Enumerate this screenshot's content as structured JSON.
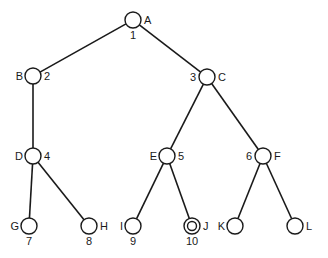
{
  "diagram": {
    "type": "tree",
    "nodes": [
      {
        "id": "A",
        "order": "1",
        "x": 133,
        "y": 20,
        "label_pos": "right",
        "order_pos": "below"
      },
      {
        "id": "B",
        "order": "2",
        "x": 33,
        "y": 76,
        "label_pos": "left",
        "order_pos": "right"
      },
      {
        "id": "C",
        "order": "3",
        "x": 207,
        "y": 77,
        "label_pos": "right",
        "order_pos": "left"
      },
      {
        "id": "D",
        "order": "4",
        "x": 33,
        "y": 156,
        "label_pos": "left",
        "order_pos": "right"
      },
      {
        "id": "E",
        "order": "5",
        "x": 167,
        "y": 156,
        "label_pos": "left",
        "order_pos": "right"
      },
      {
        "id": "F",
        "order": "6",
        "x": 263,
        "y": 156,
        "label_pos": "right",
        "order_pos": "left"
      },
      {
        "id": "G",
        "order": "7",
        "x": 29,
        "y": 226,
        "label_pos": "left",
        "order_pos": "below"
      },
      {
        "id": "H",
        "order": "8",
        "x": 89,
        "y": 226,
        "label_pos": "right",
        "order_pos": "below"
      },
      {
        "id": "I",
        "order": "9",
        "x": 133,
        "y": 226,
        "label_pos": "left",
        "order_pos": "below"
      },
      {
        "id": "J",
        "order": "10",
        "x": 192,
        "y": 226,
        "label_pos": "right",
        "order_pos": "below",
        "goal": true
      },
      {
        "id": "K",
        "order": "",
        "x": 235,
        "y": 226,
        "label_pos": "left",
        "order_pos": "none"
      },
      {
        "id": "L",
        "order": "",
        "x": 295,
        "y": 226,
        "label_pos": "right",
        "order_pos": "none"
      }
    ],
    "edges": [
      [
        "A",
        "B"
      ],
      [
        "A",
        "C"
      ],
      [
        "B",
        "D"
      ],
      [
        "C",
        "E"
      ],
      [
        "C",
        "F"
      ],
      [
        "D",
        "G"
      ],
      [
        "D",
        "H"
      ],
      [
        "E",
        "I"
      ],
      [
        "E",
        "J"
      ],
      [
        "F",
        "K"
      ],
      [
        "F",
        "L"
      ]
    ],
    "node_radius": 8,
    "colors": {
      "stroke": "#1a1a1a",
      "fill": "#ffffff",
      "background": "#ffffff"
    }
  }
}
